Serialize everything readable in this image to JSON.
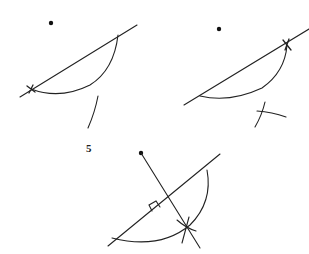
{
  "diagram": {
    "stroke_color": "#222222",
    "figures": [
      {
        "id": "step-a",
        "point": [
          51,
          23
        ],
        "line": [
          [
            20,
            97
          ],
          [
            137,
            25
          ]
        ],
        "arc": "M31,89 Q60,100 90,85 Q114,70 118,35",
        "mark": [
          31,
          89
        ],
        "partial_arc": "M98,96 Q95,112 88,128"
      },
      {
        "id": "step-b",
        "point": [
          219,
          29
        ],
        "line": [
          [
            184,
            105
          ],
          [
            309,
            29
          ]
        ],
        "arc": "M200,96 Q230,103 262,88 Q285,72 287,45",
        "mark": [
          287,
          45
        ],
        "arc_intersection": {
          "arc1": "M265,102 Q262,115 255,127",
          "arc2": "M257,111 Q272,112 286,117"
        }
      },
      {
        "id": "step-5",
        "label": "5",
        "label_pos": [
          86,
          142
        ],
        "point": [
          141,
          153
        ],
        "perpendicular": [
          [
            141,
            153
          ],
          [
            200,
            248
          ]
        ],
        "line": [
          [
            108,
            246
          ],
          [
            220,
            154
          ]
        ],
        "arc": "M112,238 Q160,250 190,225 Q213,202 207,170",
        "right_angle": "M152,211 L149,205 L156,201 L160,207",
        "cross_point": [
          186,
          228
        ],
        "cross_arcs": [
          "M177,220 Q186,228 196,231",
          "M189,217 Q185,232 182,243"
        ]
      }
    ]
  }
}
